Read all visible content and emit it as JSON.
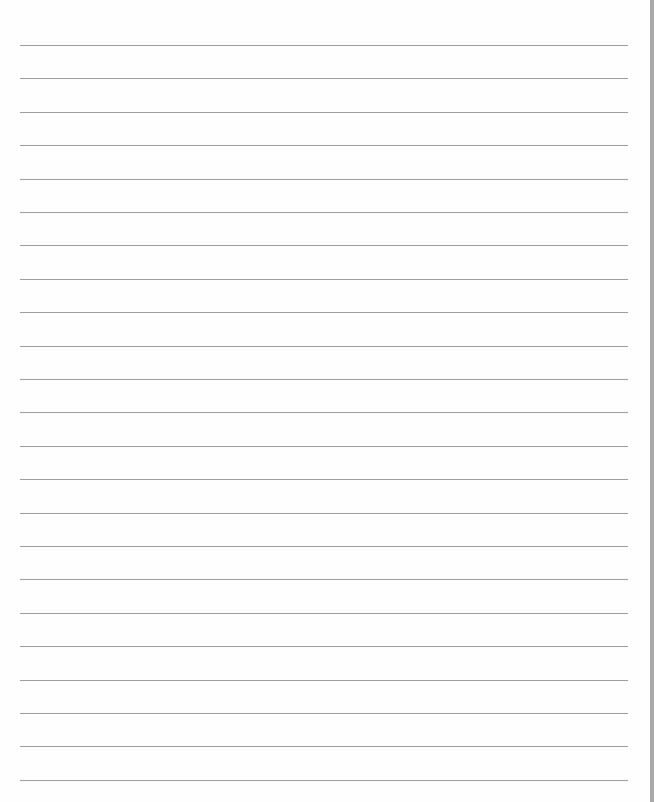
{
  "document": {
    "type": "lined-paper",
    "line_count": 23,
    "first_line_y": 45,
    "line_spacing": 33.4,
    "line_left": 20,
    "line_width": 608,
    "colors": {
      "paper": "#fefefe",
      "rule": "#8c8c8c",
      "edge": "#a9a9a9"
    }
  }
}
